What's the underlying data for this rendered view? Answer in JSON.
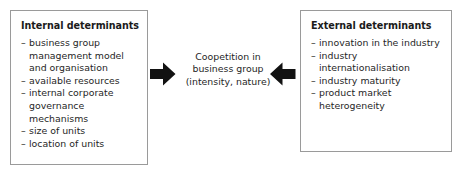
{
  "diagram": {
    "colors": {
      "box_border": "#9a9a9a",
      "box_fill": "#ffffff",
      "text": "#1f1f1f",
      "arrow": "#121212",
      "background": "#ffffff"
    },
    "left_box": {
      "heading": "Internal determinants",
      "bullet_marker": "–",
      "items": [
        "business group management model and organisation",
        "available resources",
        "internal corporate governance mechanisms",
        "size of units",
        "location of units"
      ],
      "item_lines": [
        [
          "business group",
          "management model",
          "and organisation"
        ],
        [
          "available resources"
        ],
        [
          "internal corporate",
          "governance mechanisms"
        ],
        [
          "size of units"
        ],
        [
          "location of units"
        ]
      ]
    },
    "centre": {
      "lines": [
        "Coopetition in",
        "business group",
        "(intensity, nature)"
      ],
      "text": "Coopetition in business group (intensity, nature)"
    },
    "right_box": {
      "heading": "External determinants",
      "bullet_marker": "–",
      "items": [
        "innovation in the industry",
        "industry internationalisation",
        "industry maturity",
        "product market heterogeneity"
      ],
      "item_lines": [
        [
          "innovation in the industry"
        ],
        [
          "industry internationalisation"
        ],
        [
          "industry maturity"
        ],
        [
          "product market",
          "heterogeneity"
        ]
      ]
    },
    "arrows": [
      {
        "name": "arrow-pointing-right",
        "direction": "right"
      },
      {
        "name": "arrow-pointing-left",
        "direction": "left"
      }
    ]
  }
}
